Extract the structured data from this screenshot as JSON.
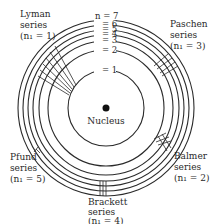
{
  "diagram": {
    "nucleus_label": "Nucleus",
    "levels": [
      {
        "n": 1,
        "label": "= 1"
      },
      {
        "n": 2,
        "label": "= 2"
      },
      {
        "n": 3,
        "label": "= 3"
      },
      {
        "n": 4,
        "label": "= 4"
      },
      {
        "n": 5,
        "label": "= 5"
      },
      {
        "n": 6,
        "label": "= 6"
      },
      {
        "n": 7,
        "label": "n = 7"
      }
    ],
    "series": [
      {
        "name": "Lyman",
        "word": "series",
        "n1": "(n₁ = 1)"
      },
      {
        "name": "Balmer",
        "word": "series",
        "n1": "(n₁ = 2)"
      },
      {
        "name": "Paschen",
        "word": "series",
        "n1": "(n₁ = 3)"
      },
      {
        "name": "Brackett",
        "word": "series",
        "n1": "(n₁ = 4)"
      },
      {
        "name": "Pfund",
        "word": "series",
        "n1": "(n₁ = 5)"
      }
    ],
    "colors": {
      "ink": "#2a2a2a",
      "background": "#ffffff"
    }
  }
}
